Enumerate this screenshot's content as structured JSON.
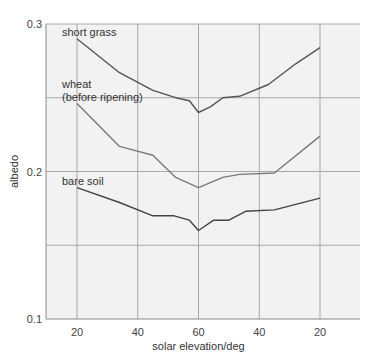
{
  "chart_data": {
    "type": "line",
    "title": "",
    "xlabel": "solar elevation/deg",
    "ylabel": "albedo",
    "ylim": [
      0.1,
      0.3
    ],
    "y_ticks": [
      0.1,
      0.2,
      0.3
    ],
    "y_tick_labels": [
      "0.1",
      "0.2",
      "0.3"
    ],
    "y_gridlines": [
      0.15,
      0.2,
      0.25,
      0.3
    ],
    "x_position_range": [
      10,
      113
    ],
    "x_ticks_position": [
      20,
      40,
      60,
      80,
      100
    ],
    "x_tick_labels": [
      "20",
      "40",
      "60",
      "40",
      "20"
    ],
    "grid": true,
    "legend": "inline labels at left",
    "note": "x runs from rising sun (20 deg) through solar noon (60 deg) to setting sun (20 deg); x values given as position along axis",
    "series": [
      {
        "name": "short grass",
        "label_lines": [
          "short grass"
        ],
        "x": [
          20,
          34,
          45,
          52.5,
          57,
          60,
          64,
          68,
          73.5,
          83,
          92,
          100
        ],
        "values": [
          0.29,
          0.267,
          0.255,
          0.25,
          0.248,
          0.24,
          0.244,
          0.25,
          0.251,
          0.259,
          0.273,
          0.284
        ]
      },
      {
        "name": "wheat (before ripening)",
        "label_lines": [
          "wheat",
          "(before ripening)"
        ],
        "x": [
          20,
          34,
          45,
          52.5,
          60,
          68,
          73.5,
          85,
          100
        ],
        "values": [
          0.246,
          0.217,
          0.211,
          0.196,
          0.189,
          0.196,
          0.198,
          0.199,
          0.224
        ]
      },
      {
        "name": "bare soil",
        "label_lines": [
          "bare soil"
        ],
        "x": [
          20,
          34,
          45,
          52,
          57,
          60,
          65,
          70,
          75.5,
          85,
          100
        ],
        "values": [
          0.189,
          0.179,
          0.17,
          0.17,
          0.167,
          0.16,
          0.167,
          0.167,
          0.173,
          0.174,
          0.182
        ]
      }
    ]
  },
  "colors": {
    "plot_background": "#f2f2f2",
    "gridline": "#a8a8a8",
    "short_grass_line": "#555555",
    "wheat_line": "#7a7a7a",
    "bare_soil_line": "#444444"
  }
}
